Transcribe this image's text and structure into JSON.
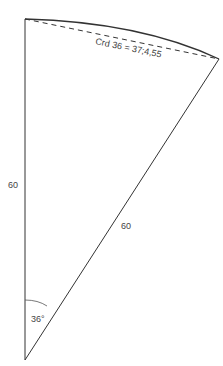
{
  "figure": {
    "type": "circular sector with chord",
    "angle_label": "36°",
    "radius_left_label": "60",
    "radius_diagonal_label": "60",
    "chord_label": "Crd 36 = 37;4,55",
    "colors": {
      "stroke": "#333333",
      "text": "#444444",
      "background": "#ffffff"
    }
  }
}
